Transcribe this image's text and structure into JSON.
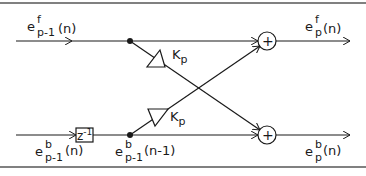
{
  "diagram": {
    "inputs": {
      "forward": {
        "base": "e",
        "sup": "f",
        "sub": "p-1",
        "arg": "(n)"
      },
      "backward": {
        "base": "e",
        "sup": "b",
        "sub": "p-1",
        "arg": "(n)"
      }
    },
    "delayed_backward": {
      "base": "e",
      "sup": "b",
      "sub": "p-1",
      "arg": "(n-1)"
    },
    "outputs": {
      "forward": {
        "base": "e",
        "sup": "f",
        "sub": "p",
        "arg": "(n)"
      },
      "backward": {
        "base": "e",
        "sup": "b",
        "sub": "p",
        "arg": "(n)"
      }
    },
    "delay_block": {
      "base": "z",
      "exp": "-1"
    },
    "gains": [
      {
        "base": "K",
        "sub": "p"
      },
      {
        "base": "K",
        "sub": "p"
      }
    ],
    "summers": [
      {
        "symbol": "+"
      },
      {
        "symbol": "+"
      }
    ],
    "colors": {
      "line": "#1a1a1a",
      "frame": "#808080"
    }
  }
}
